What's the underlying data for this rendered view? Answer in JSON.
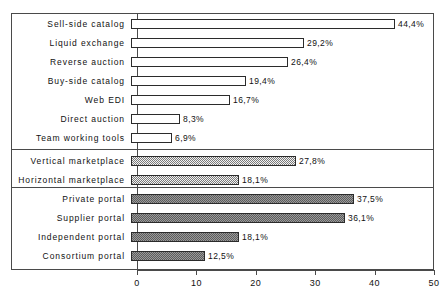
{
  "chart_data": {
    "type": "bar",
    "orientation": "horizontal",
    "title": "",
    "xlabel": "",
    "ylabel": "",
    "xlim": [
      0,
      50
    ],
    "xticks": [
      0,
      10,
      20,
      30,
      40,
      50
    ],
    "xtick_labels": [
      "0",
      "10",
      "20",
      "30",
      "40",
      "50"
    ],
    "grid": false,
    "legend": "none",
    "value_suffix": "%",
    "decimal_separator": ",",
    "groups": [
      {
        "name": "e-marketplace-mechanisms",
        "fill": "plain",
        "items": [
          {
            "label": "Sell-side catalog",
            "value": 44.4,
            "value_label": "44,4%"
          },
          {
            "label": "Liquid exchange",
            "value": 29.2,
            "value_label": "29,2%"
          },
          {
            "label": "Reverse auction",
            "value": 26.4,
            "value_label": "26,4%"
          },
          {
            "label": "Buy-side catalog",
            "value": 19.4,
            "value_label": "19,4%"
          },
          {
            "label": "Web EDI",
            "value": 16.7,
            "value_label": "16,7%"
          },
          {
            "label": "Direct auction",
            "value": 8.3,
            "value_label": "8,3%"
          },
          {
            "label": "Team working tools",
            "value": 6.9,
            "value_label": "6,9%"
          }
        ]
      },
      {
        "name": "marketplace-orientation",
        "fill": "dots",
        "items": [
          {
            "label": "Vertical marketplace",
            "value": 27.8,
            "value_label": "27,8%"
          },
          {
            "label": "Horizontal marketplace",
            "value": 18.1,
            "value_label": "18,1%"
          }
        ]
      },
      {
        "name": "portal-ownership",
        "fill": "hatch",
        "items": [
          {
            "label": "Private portal",
            "value": 37.5,
            "value_label": "37,5%"
          },
          {
            "label": "Supplier portal",
            "value": 36.1,
            "value_label": "36,1%"
          },
          {
            "label": "Independent portal",
            "value": 18.1,
            "value_label": "18,1%"
          },
          {
            "label": "Consortium portal",
            "value": 12.5,
            "value_label": "12,5%"
          }
        ]
      }
    ],
    "colors": {
      "frame": "#4a4a4a",
      "bar_outline": "#2b2b2b",
      "plain_fill": "#ffffff",
      "dots_fill": "#7a7a7a",
      "hatch_fill": "#5d5d5d",
      "text": "#111111",
      "background": "#ffffff"
    }
  }
}
